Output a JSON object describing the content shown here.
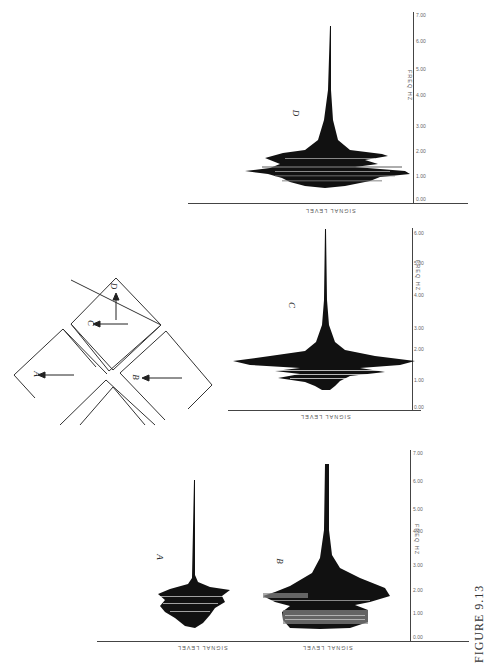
{
  "figure": {
    "caption": "FIGURE 9.13",
    "orientation": "rotated 90 degrees (landscape page)",
    "diagram": {
      "labels": [
        "A",
        "B",
        "C",
        "D"
      ],
      "description": "Four squares arranged in a diamond/X pattern with directional arrows labeled A, B, C and D"
    },
    "panels": [
      {
        "id": "D",
        "label": "D",
        "x_axis_title": "FREQ HZ",
        "y_axis_title": "SIGNAL LEVEL",
        "x_ticks": [
          "0.00",
          "1.00",
          "2.00",
          "3.00",
          "4.00",
          "5.00",
          "6.00",
          "7.00"
        ],
        "y_ticks": [
          "-1.25",
          "-1.00",
          "-.75",
          "-.50",
          "-.25",
          ".00",
          ".25",
          ".50",
          ".75",
          "1.00",
          "1.25"
        ]
      },
      {
        "id": "C",
        "label": "C",
        "x_axis_title": "FREQ HZ",
        "y_axis_title": "SIGNAL LEVEL",
        "x_ticks": [
          "0.00",
          "1.00",
          "2.00",
          "3.00",
          "4.00",
          "5.00",
          "6.00",
          "7.00",
          "8.00"
        ],
        "y_ticks": [
          "-.75",
          "-.50",
          "-.25",
          ".00",
          ".25",
          ".50",
          ".75"
        ]
      },
      {
        "id": "A",
        "label": "A",
        "y_axis_title": "SIGNAL LEVEL",
        "y_ticks": [
          "-1.00",
          "-.75",
          "-.50",
          "-.25",
          ".00",
          ".25",
          ".50",
          ".75"
        ]
      },
      {
        "id": "B",
        "label": "B",
        "x_axis_title": "FREQ HZ",
        "y_axis_title": "SIGNAL LEVEL",
        "x_ticks": [
          "0.00",
          "1.00",
          "2.00",
          "3.00",
          "4.00",
          "5.00",
          "6.00",
          "7.00",
          "8.00"
        ],
        "y_ticks": [
          "-2.50",
          "-2.00",
          "-1.50",
          "-1.00",
          "-.50",
          ".00",
          ".50",
          "1.00",
          "1.50"
        ]
      }
    ]
  }
}
